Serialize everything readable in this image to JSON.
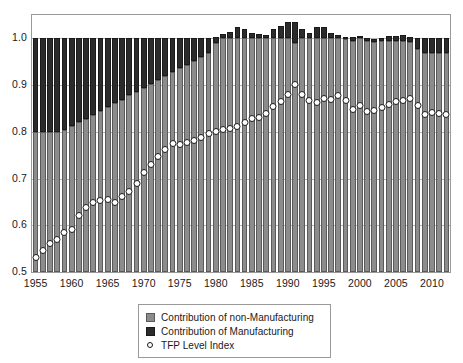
{
  "chart_data": {
    "type": "bar",
    "title": "",
    "subtitle": "",
    "xlabel": "",
    "ylabel": "",
    "ylim": [
      0.5,
      1.05
    ],
    "yticks": [
      0.5,
      0.6,
      0.7,
      0.8,
      0.9,
      1.0
    ],
    "ytick_labels": [
      "0.5",
      "0.6",
      "0.7",
      "0.8",
      "0.9",
      "1.0"
    ],
    "xticks": [
      1955,
      1960,
      1965,
      1970,
      1975,
      1980,
      1985,
      1990,
      1995,
      2000,
      2005,
      2010
    ],
    "xtick_labels": [
      "1955",
      "1960",
      "1965",
      "1970",
      "1975",
      "1980",
      "1985",
      "1990",
      "1995",
      "2000",
      "2005",
      "2010"
    ],
    "grid": true,
    "stacked": true,
    "legend_position": "bottom-center",
    "baseline": 0.5,
    "categories": [
      1955,
      1956,
      1957,
      1958,
      1959,
      1960,
      1961,
      1962,
      1963,
      1964,
      1965,
      1966,
      1967,
      1968,
      1969,
      1970,
      1971,
      1972,
      1973,
      1974,
      1975,
      1976,
      1977,
      1978,
      1979,
      1980,
      1981,
      1982,
      1983,
      1984,
      1985,
      1986,
      1987,
      1988,
      1989,
      1990,
      1991,
      1992,
      1993,
      1994,
      1995,
      1996,
      1997,
      1998,
      1999,
      2000,
      2001,
      2002,
      2003,
      2004,
      2005,
      2006,
      2007,
      2008,
      2009,
      2010,
      2011,
      2012
    ],
    "series": [
      {
        "name": "Contribution of non-Manufacturing",
        "color": "#8c8c8c",
        "values": [
          0.8,
          0.8,
          0.8,
          0.8,
          0.803,
          0.812,
          0.82,
          0.828,
          0.836,
          0.845,
          0.853,
          0.861,
          0.869,
          0.878,
          0.886,
          0.894,
          0.902,
          0.91,
          0.919,
          0.927,
          0.936,
          0.944,
          0.952,
          0.96,
          0.968,
          0.99,
          1.0,
          1.0,
          1.0,
          1.0,
          1.0,
          1.0,
          1.0,
          1.0,
          1.0,
          1.0,
          0.99,
          1.0,
          1.0,
          1.0,
          1.0,
          1.0,
          1.0,
          0.998,
          0.995,
          1.0,
          0.995,
          0.993,
          0.995,
          0.995,
          0.995,
          0.995,
          0.993,
          0.978,
          0.968,
          0.968,
          0.968,
          0.968
        ]
      },
      {
        "name": "Contribution of Manufacturing",
        "color": "#2b2b2b",
        "values": [
          0.2,
          0.2,
          0.2,
          0.2,
          0.197,
          0.188,
          0.18,
          0.172,
          0.164,
          0.155,
          0.147,
          0.139,
          0.131,
          0.122,
          0.114,
          0.106,
          0.098,
          0.09,
          0.081,
          0.073,
          0.064,
          0.056,
          0.048,
          0.04,
          0.032,
          0.013,
          0.01,
          0.014,
          0.024,
          0.02,
          0.012,
          0.01,
          0.008,
          0.019,
          0.026,
          0.035,
          0.045,
          0.02,
          0.012,
          0.024,
          0.024,
          0.012,
          0.008,
          0.004,
          0.007,
          0.005,
          0.005,
          0.005,
          0.005,
          0.01,
          0.01,
          0.012,
          0.01,
          0.022,
          0.032,
          0.032,
          0.032,
          0.032
        ]
      }
    ],
    "overlay": {
      "name": "TFP Level Index",
      "marker": "open-circle",
      "color": "#1a1a1a",
      "values": [
        0.53,
        0.545,
        0.56,
        0.57,
        0.585,
        0.592,
        0.62,
        0.638,
        0.648,
        0.652,
        0.655,
        0.648,
        0.662,
        0.672,
        0.69,
        0.712,
        0.73,
        0.748,
        0.762,
        0.776,
        0.772,
        0.778,
        0.782,
        0.788,
        0.796,
        0.8,
        0.806,
        0.808,
        0.812,
        0.82,
        0.828,
        0.83,
        0.84,
        0.855,
        0.865,
        0.88,
        0.902,
        0.88,
        0.866,
        0.862,
        0.872,
        0.87,
        0.878,
        0.868,
        0.848,
        0.856,
        0.844,
        0.846,
        0.852,
        0.858,
        0.864,
        0.868,
        0.872,
        0.856,
        0.838,
        0.842,
        0.84,
        0.838
      ]
    },
    "legend": [
      {
        "label": "Contribution of non-Manufacturing",
        "swatch": "nonmfg"
      },
      {
        "label": "Contribution of Manufacturing",
        "swatch": "mfg"
      },
      {
        "label": "TFP Level Index",
        "swatch": "tfp"
      }
    ]
  }
}
